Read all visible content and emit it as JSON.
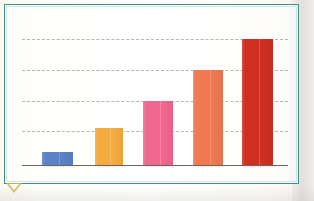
{
  "figure": {
    "frame_color": "#3f8f86",
    "background_color": "#fdfcf8",
    "baseline_color": "#5c5a58",
    "gridline_color": "#9a9a9a",
    "corner_marker_color": "#c9bb59",
    "corner_marker_name": "triangle-marker"
  },
  "chart_data": {
    "type": "bar",
    "title": "",
    "subtitle": "",
    "xlabel": "",
    "ylabel": "",
    "categories": [
      "1",
      "2",
      "3",
      "4",
      "5"
    ],
    "values": [
      0.42,
      1.19,
      2.06,
      3.06,
      4.05
    ],
    "ylim": [
      0,
      4.4
    ],
    "yticks": [
      1,
      2,
      3,
      4
    ],
    "ytick_labels": [
      "",
      "",
      "",
      ""
    ],
    "xtick_labels": [
      "",
      "",
      "",
      "",
      ""
    ],
    "grid": true,
    "grid_style": "dashed",
    "grid_axis": "y",
    "legend": false,
    "legend_position": "none",
    "bar_colors": [
      "#5b82c6",
      "#f4ac3f",
      "#f2678d",
      "#f0794f",
      "#cf3022"
    ],
    "bars": [
      {
        "label": "1",
        "value": 0.42,
        "color": "#5b82c6",
        "x": 42,
        "width": 31,
        "top": 152
      },
      {
        "label": "2",
        "value": 1.19,
        "color": "#f4ac3f",
        "x": 95,
        "width": 28,
        "top": 128
      },
      {
        "label": "3",
        "value": 2.06,
        "color": "#f2678d",
        "x": 143,
        "width": 30,
        "top": 101
      },
      {
        "label": "4",
        "value": 3.06,
        "color": "#f0794f",
        "x": 193,
        "width": 30,
        "top": 70
      },
      {
        "label": "5",
        "value": 4.05,
        "color": "#cf3022",
        "x": 242,
        "width": 31,
        "top": 39
      }
    ],
    "gridline_y_px": [
      39,
      70,
      101,
      131
    ],
    "baseline_y_px": 165,
    "plot_left_px": 22,
    "plot_right_px": 288
  }
}
